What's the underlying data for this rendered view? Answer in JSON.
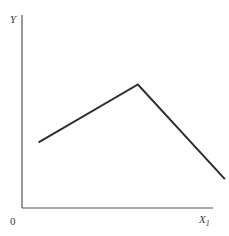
{
  "chart_data": {
    "type": "line",
    "title": "",
    "xlabel": "X1",
    "ylabel": "Y",
    "origin_label": "0",
    "grid": false,
    "legend": null,
    "x": [
      0.08,
      0.56,
      0.98
    ],
    "series": [
      {
        "name": "Y",
        "values": [
          0.34,
          0.64,
          0.15
        ]
      }
    ],
    "xlim": [
      0,
      1
    ],
    "ylim": [
      0,
      1
    ],
    "line_color": "#2e2e2e",
    "axis_color": "#555555"
  },
  "labels": {
    "y_axis": "Y",
    "x_axis_main": "X",
    "x_axis_sub": "1",
    "origin": "0"
  }
}
